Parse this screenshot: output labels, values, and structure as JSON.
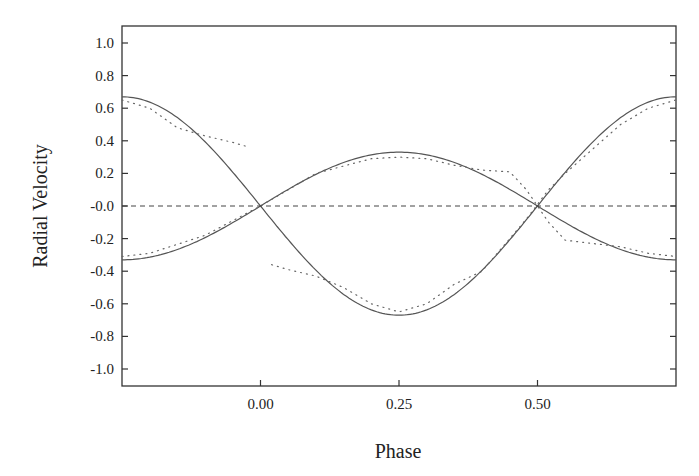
{
  "chart_data": {
    "type": "line",
    "title": "",
    "xlabel": "Phase",
    "ylabel": "Radial Velocity",
    "xlim": [
      -0.25,
      0.75
    ],
    "ylim": [
      -1.1,
      1.1
    ],
    "x_ticks": [
      0.0,
      0.25,
      0.5
    ],
    "x_tick_labels": [
      "0.00",
      "0.25",
      "0.50"
    ],
    "y_ticks": [
      1.0,
      0.8,
      0.6,
      0.4,
      0.2,
      0.0,
      -0.2,
      -0.4,
      -0.6,
      -0.8,
      -1.0
    ],
    "y_tick_labels": [
      "1.0",
      "0.8",
      "0.6",
      "0.4",
      "0.2",
      "-0.0",
      "-0.2",
      "-0.4",
      "-0.6",
      "-0.8",
      "-1.0"
    ],
    "grid": false,
    "legend": null,
    "series": [
      {
        "name": "Primary model (solid)",
        "style": "solid",
        "formula": "-0.67*sin(2*pi*phase)",
        "x": [
          -0.25,
          -0.125,
          0.0,
          0.125,
          0.25,
          0.375,
          0.5,
          0.625,
          0.75
        ],
        "values": [
          0.67,
          0.47,
          0.0,
          -0.47,
          -0.67,
          -0.47,
          0.0,
          0.47,
          0.67
        ]
      },
      {
        "name": "Secondary model (solid)",
        "style": "solid",
        "formula": "0.33*sin(2*pi*phase)",
        "x": [
          -0.25,
          -0.125,
          0.0,
          0.125,
          0.25,
          0.375,
          0.5,
          0.625,
          0.75
        ],
        "values": [
          -0.33,
          -0.23,
          0.0,
          0.23,
          0.33,
          0.23,
          0.0,
          -0.23,
          -0.33
        ]
      },
      {
        "name": "Primary observed (dotted)",
        "style": "dotted",
        "x": [
          -0.25,
          -0.2,
          -0.15,
          -0.1,
          -0.05,
          -0.02,
          0.02,
          0.05,
          0.1,
          0.15,
          0.2,
          0.25,
          0.3,
          0.35,
          0.4,
          0.45,
          0.48,
          0.52,
          0.55,
          0.6,
          0.65,
          0.7,
          0.75
        ],
        "values": [
          0.65,
          0.6,
          0.48,
          0.43,
          0.39,
          0.36,
          -0.36,
          -0.39,
          -0.43,
          -0.5,
          -0.6,
          -0.65,
          -0.6,
          -0.48,
          -0.4,
          -0.2,
          -0.08,
          0.1,
          0.2,
          0.35,
          0.5,
          0.6,
          0.65
        ]
      },
      {
        "name": "Secondary observed (dotted)",
        "style": "dotted",
        "x": [
          -0.25,
          -0.2,
          -0.1,
          0.0,
          0.1,
          0.2,
          0.25,
          0.3,
          0.35,
          0.4,
          0.45,
          0.48,
          0.52,
          0.55,
          0.6,
          0.65,
          0.7,
          0.75
        ],
        "values": [
          -0.31,
          -0.29,
          -0.18,
          0.0,
          0.2,
          0.29,
          0.3,
          0.29,
          0.25,
          0.22,
          0.21,
          0.1,
          -0.1,
          -0.21,
          -0.23,
          -0.25,
          -0.29,
          -0.31
        ]
      },
      {
        "name": "Zero line (dashed)",
        "style": "dashed",
        "x": [
          -0.25,
          0.75
        ],
        "values": [
          0.0,
          0.0
        ]
      }
    ]
  }
}
